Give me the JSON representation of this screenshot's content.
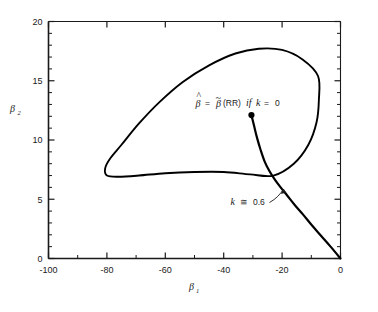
{
  "chart_data": {
    "type": "line",
    "title": "",
    "subtitle": "",
    "xlabel": "β₁",
    "ylabel": "β₂",
    "xlim": [
      -100,
      0
    ],
    "ylim": [
      0,
      20
    ],
    "grid": false,
    "legend_position": "none",
    "x_ticks": [
      -100,
      -80,
      -60,
      -40,
      -20,
      0
    ],
    "x_tick_labels": [
      "-100",
      "-80",
      "-60",
      "-40",
      "-20",
      "0"
    ],
    "x_minor_tick_step": 10,
    "y_ticks": [
      0,
      5,
      10,
      15,
      20
    ],
    "y_tick_labels": [
      "0",
      "5",
      "10",
      "15",
      "20"
    ],
    "y_minor_tick_step": 1,
    "series": [
      {
        "name": "residual-sum-of-squares-contour",
        "type": "closed-ellipse",
        "center": [
          -44,
          12.2
        ],
        "semi_major": 36.5,
        "semi_minor": 22.0,
        "rotation_deg": -16,
        "points": [
          [
            -7.7,
            15.4
          ],
          [
            -13.0,
            16.8
          ],
          [
            -20.0,
            17.6
          ],
          [
            -28.0,
            17.7
          ],
          [
            -36.0,
            17.3
          ],
          [
            -45.0,
            16.3
          ],
          [
            -54.0,
            14.9
          ],
          [
            -62.0,
            13.2
          ],
          [
            -69.0,
            11.4
          ],
          [
            -75.0,
            9.6
          ],
          [
            -79.0,
            8.4
          ],
          [
            -80.6,
            7.6
          ],
          [
            -80.0,
            7.0
          ],
          [
            -76.0,
            6.9
          ],
          [
            -69.0,
            7.0
          ],
          [
            -60.0,
            7.2
          ],
          [
            -50.0,
            7.3
          ],
          [
            -40.0,
            7.3
          ],
          [
            -31.0,
            7.1
          ],
          [
            -23.0,
            7.0
          ],
          [
            -16.0,
            8.0
          ],
          [
            -11.0,
            9.6
          ],
          [
            -8.2,
            11.5
          ],
          [
            -7.4,
            13.4
          ],
          [
            -7.7,
            15.4
          ]
        ]
      },
      {
        "name": "ridge-trace",
        "type": "open-curve",
        "points": [
          [
            -30.5,
            12.1
          ],
          [
            -29.6,
            11.2
          ],
          [
            -28.6,
            10.2
          ],
          [
            -27.4,
            9.2
          ],
          [
            -26.0,
            8.2
          ],
          [
            -24.4,
            7.4
          ],
          [
            -22.6,
            6.7
          ],
          [
            -20.5,
            6.0
          ],
          [
            -18.2,
            5.3
          ],
          [
            -15.6,
            4.5
          ],
          [
            -12.8,
            3.7
          ],
          [
            -9.8,
            2.8
          ],
          [
            -6.6,
            1.9
          ],
          [
            -3.4,
            1.0
          ],
          [
            0.0,
            0.0
          ]
        ]
      }
    ],
    "points": [
      {
        "name": "ols-estimate-point",
        "x": -30.5,
        "y": 12.1,
        "marker": "filled-circle",
        "label": "β̂ = β̃(RR) if k = 0"
      }
    ],
    "annotations": [
      {
        "name": "ols-estimate-label",
        "text_parts": {
          "beta_hat": "β",
          "equals": "=",
          "beta_tilde": "β",
          "rr": "(RR)",
          "if": "if",
          "k": "k",
          "equals2": "=",
          "zero": "0"
        },
        "full_text": "β̂ = β̃(RR) if k = 0",
        "x": -44,
        "y": 13.8
      },
      {
        "name": "k-value-label",
        "text_parts": {
          "k": "k",
          "approx": "≅",
          "value": "0.6"
        },
        "full_text": "k ≅ 0.6",
        "x": -47,
        "y": 4.4,
        "arrow_target": [
          -23.3,
          7.05
        ]
      }
    ],
    "colors": {
      "axis": "#1a1a1a",
      "curve": "#000000",
      "background": "#ffffff",
      "text": "#1a1a1a"
    }
  }
}
